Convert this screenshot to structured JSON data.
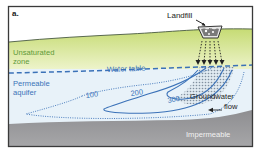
{
  "panel_label": "a.",
  "labels": {
    "landfill": "Landfill",
    "unsaturated_line1": "Unsaturated",
    "unsaturated_line2": "zone",
    "water_table": "Water table",
    "aquifer_line1": "Permeable",
    "aquifer_line2": "aquifer",
    "groundwater_line1": "Groundwater",
    "groundwater_line2": "flow",
    "impermeable": "Impermeable"
  },
  "contours": [
    {
      "value": "100",
      "style": "dotted"
    },
    {
      "value": "200",
      "style": "solid"
    },
    {
      "value": "300",
      "style": "solid"
    }
  ],
  "colors": {
    "frame": "#3a3a3a",
    "sky": "#ffffff",
    "unsaturated_top": "#c9dd7a",
    "unsaturated_bottom": "#eef3c8",
    "green_text": "#5f9a3a",
    "aquifer": "#e6f1f8",
    "blue": "#3b72b8",
    "impermeable": "#9a9a9c",
    "impermeable_dark": "#7d7d80",
    "text_dark": "#222222",
    "text_light": "#f2f2f2"
  }
}
